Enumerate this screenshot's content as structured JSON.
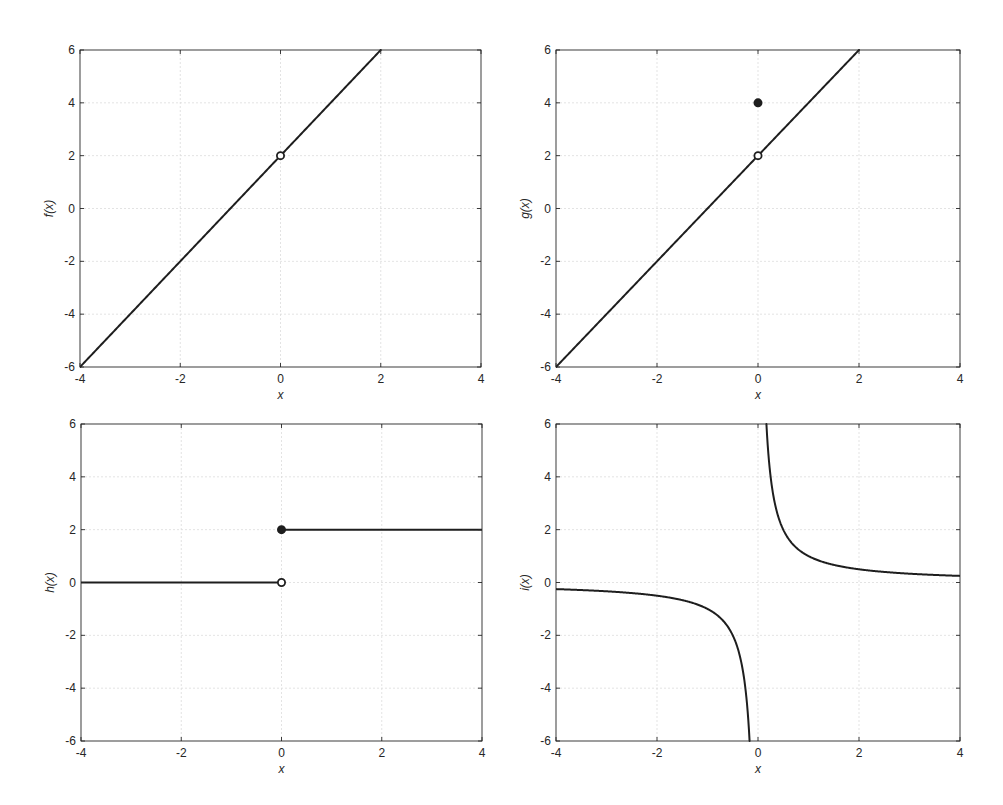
{
  "figure": {
    "width": 1003,
    "height": 805,
    "colors": {
      "line": "#1e1e1e",
      "grid": "#dcdcdc",
      "axes": "#262626",
      "background": "#ffffff"
    }
  },
  "chart_data": [
    {
      "type": "line",
      "title": "",
      "xlabel": "x",
      "ylabel": "f(x)",
      "xlim": [
        -4,
        4
      ],
      "ylim": [
        -6,
        6
      ],
      "xticks": [
        -4,
        -2,
        0,
        2,
        4
      ],
      "yticks": [
        -6,
        -4,
        -2,
        0,
        2,
        4,
        6
      ],
      "grid": true,
      "series": [
        {
          "name": "f(x) = 2x + 2, x ≠ 0",
          "kind": "function",
          "expr": "2*x+2",
          "x": [
            -4,
            2
          ],
          "y": [
            -6,
            6
          ]
        }
      ],
      "markers": [
        {
          "x": 0,
          "y": 2,
          "style": "open"
        }
      ],
      "box": {
        "left": 80,
        "top": 50,
        "right": 481,
        "bottom": 367
      }
    },
    {
      "type": "line",
      "title": "",
      "xlabel": "x",
      "ylabel": "g(x)",
      "xlim": [
        -4,
        4
      ],
      "ylim": [
        -6,
        6
      ],
      "xticks": [
        -4,
        -2,
        0,
        2,
        4
      ],
      "yticks": [
        -6,
        -4,
        -2,
        0,
        2,
        4,
        6
      ],
      "grid": true,
      "series": [
        {
          "name": "g(x) = 2x + 2, x ≠ 0",
          "kind": "function",
          "expr": "2*x+2",
          "x": [
            -4,
            2
          ],
          "y": [
            -6,
            6
          ]
        }
      ],
      "markers": [
        {
          "x": 0,
          "y": 2,
          "style": "open"
        },
        {
          "x": 0,
          "y": 4,
          "style": "filled"
        }
      ],
      "box": {
        "left": 556,
        "top": 50,
        "right": 960,
        "bottom": 367
      }
    },
    {
      "type": "line",
      "title": "",
      "xlabel": "x",
      "ylabel": "h(x)",
      "xlim": [
        -4,
        4
      ],
      "ylim": [
        -6,
        6
      ],
      "xticks": [
        -4,
        -2,
        0,
        2,
        4
      ],
      "yticks": [
        -6,
        -4,
        -2,
        0,
        2,
        4,
        6
      ],
      "grid": true,
      "series": [
        {
          "name": "h(x) = 0, x < 0",
          "kind": "segment",
          "x": [
            -4,
            0
          ],
          "y": [
            0,
            0
          ]
        },
        {
          "name": "h(x) = 2, x ≥ 0",
          "kind": "segment",
          "x": [
            0,
            4
          ],
          "y": [
            2,
            2
          ]
        }
      ],
      "markers": [
        {
          "x": 0,
          "y": 0,
          "style": "open"
        },
        {
          "x": 0,
          "y": 2,
          "style": "filled"
        }
      ],
      "box": {
        "left": 81,
        "top": 424,
        "right": 482,
        "bottom": 741
      }
    },
    {
      "type": "line",
      "title": "",
      "xlabel": "x",
      "ylabel": "i(x)",
      "xlim": [
        -4,
        4
      ],
      "ylim": [
        -6,
        6
      ],
      "xticks": [
        -4,
        -2,
        0,
        2,
        4
      ],
      "yticks": [
        -6,
        -4,
        -2,
        0,
        2,
        4,
        6
      ],
      "grid": true,
      "series": [
        {
          "name": "i(x) = 1/x, x < 0",
          "kind": "function",
          "expr": "1/x",
          "x": [
            -4,
            -0.1667
          ],
          "y": [
            -0.25,
            -6
          ]
        },
        {
          "name": "i(x) = 1/x, x > 0",
          "kind": "function",
          "expr": "1/x",
          "x": [
            0.1667,
            4
          ],
          "y": [
            6,
            0.25
          ]
        }
      ],
      "markers": [],
      "box": {
        "left": 556,
        "top": 424,
        "right": 960,
        "bottom": 741
      }
    }
  ]
}
